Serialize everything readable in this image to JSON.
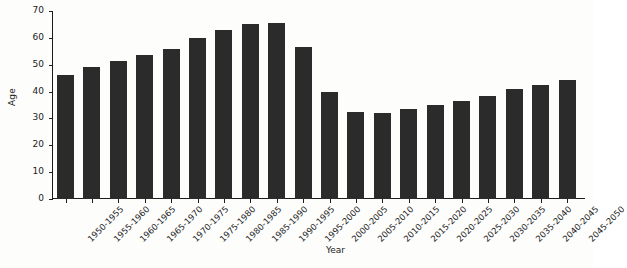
{
  "chart_data": {
    "type": "bar",
    "title": "",
    "xlabel": "Year",
    "ylabel": "Age",
    "ylim": [
      0,
      70
    ],
    "yticks": [
      0,
      10,
      20,
      30,
      40,
      50,
      60,
      70
    ],
    "grid": false,
    "legend": null,
    "bar_color": "#2b2b2b",
    "background_color": "#fdfdfc",
    "categories": [
      "1950-1955",
      "1955-1960",
      "1960-1965",
      "1965-1970",
      "1970-1975",
      "1975-1980",
      "1980-1985",
      "1985-1990",
      "1990-1995",
      "1995-2000",
      "2000-2005",
      "2005-2010",
      "2010-2015",
      "2015-2020",
      "2020-2025",
      "2025-2030",
      "2030-2035",
      "2035-2040",
      "2040-2045",
      "2045-2050"
    ],
    "values": [
      46,
      49,
      51.5,
      53.5,
      56,
      60,
      63,
      65,
      65.5,
      56.5,
      40,
      32.5,
      32,
      33.5,
      35,
      36.5,
      38.5,
      41,
      42.5,
      44.5
    ]
  }
}
